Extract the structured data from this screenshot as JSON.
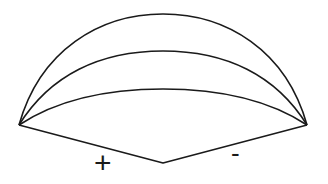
{
  "diagram": {
    "labels": {
      "positive": "+",
      "negative": "-"
    },
    "colors": {
      "stroke": "#1a1a1a",
      "background": "#ffffff"
    },
    "vertices": {
      "left": [
        19,
        125
      ],
      "right": [
        307,
        125
      ],
      "bottom": [
        163,
        163
      ]
    },
    "arcs": [
      {
        "name": "outer",
        "peak_y": 14
      },
      {
        "name": "middle",
        "peak_y": 51
      },
      {
        "name": "inner",
        "peak_y": 89
      }
    ]
  }
}
